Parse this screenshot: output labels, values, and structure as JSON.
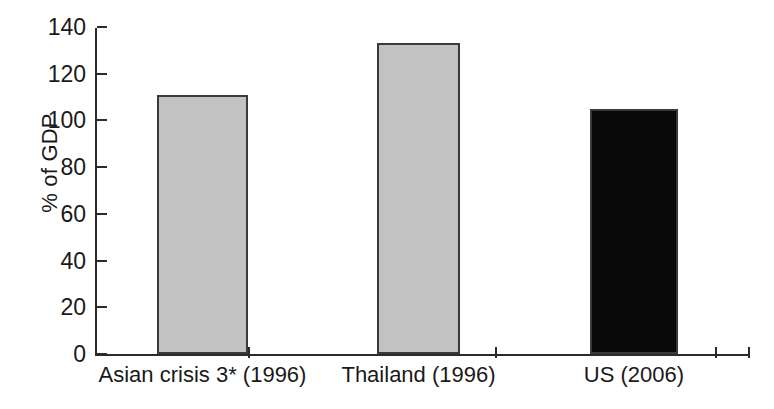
{
  "chart_data": {
    "type": "bar",
    "title": "",
    "subtitle": "",
    "xlabel": "",
    "ylabel": "% of GDP",
    "categories": [
      "Asian crisis 3* (1996)",
      "Thailand (1996)",
      "US (2006)"
    ],
    "values": [
      111,
      133,
      105
    ],
    "series": [
      {
        "name": "% of GDP",
        "values": [
          111,
          133,
          105
        ]
      }
    ],
    "ylim": [
      0,
      140
    ],
    "ytick_step": 20,
    "ytick_labels": [
      "0",
      "20",
      "40",
      "60",
      "80",
      "100",
      "120",
      "140"
    ],
    "ytick_values": [
      0,
      20,
      40,
      60,
      80,
      100,
      120,
      140
    ],
    "grid": false,
    "legend": false,
    "legend_position": "none",
    "bar_colors": [
      "#c2c2c2",
      "#c2c2c2",
      "#0a0a0a"
    ],
    "bar_edge_color": "#3a3a3a",
    "axis_color": "#2b2b2b",
    "background": "#ffffff",
    "annotations": []
  },
  "axis": {
    "y_label": "% of GDP",
    "ticks": [
      {
        "label": "140",
        "value": 140
      },
      {
        "label": "120",
        "value": 120
      },
      {
        "label": "100",
        "value": 100
      },
      {
        "label": "80",
        "value": 80
      },
      {
        "label": "60",
        "value": 60
      },
      {
        "label": "40",
        "value": 40
      },
      {
        "label": "20",
        "value": 20
      },
      {
        "label": "0",
        "value": 0
      }
    ]
  },
  "bars": [
    {
      "label": "Asian crisis 3* (1996)",
      "value": 111,
      "color": "#c2c2c2"
    },
    {
      "label": "Thailand (1996)",
      "value": 133,
      "color": "#c2c2c2"
    },
    {
      "label": "US (2006)",
      "value": 105,
      "color": "#0a0a0a"
    }
  ]
}
